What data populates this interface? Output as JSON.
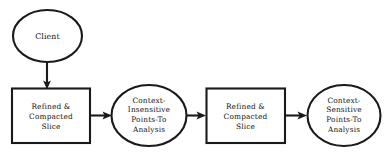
{
  "diagram": {
    "type": "flowchart",
    "background_color": "#ffffff",
    "stroke_color": "#1a1a1a",
    "text_color": "#111111",
    "nodes": [
      {
        "id": "client",
        "shape": "ellipse",
        "label": "Client",
        "lines": [
          "Client"
        ]
      },
      {
        "id": "refined-compacted-slice-1",
        "shape": "rectangle",
        "label": "Refined & Compacted Slice",
        "lines": [
          "Refined &",
          "Compacted",
          "Slice"
        ]
      },
      {
        "id": "context-insensitive-points-to-analysis",
        "shape": "ellipse",
        "label": "Context-Insensitive Points-To Analysis",
        "lines": [
          "Context-",
          "Insensitive",
          "Points-To",
          "Analysis"
        ]
      },
      {
        "id": "refined-compacted-slice-2",
        "shape": "rectangle",
        "label": "Refined & Compacted Slice",
        "lines": [
          "Refined &",
          "Compacted",
          "Slice"
        ]
      },
      {
        "id": "context-sensitive-points-to-analysis",
        "shape": "ellipse",
        "label": "Context-Sensitive Points-To Analysis",
        "lines": [
          "Context-",
          "Sensitive",
          "Points-To",
          "Analysis"
        ]
      }
    ],
    "edges": [
      {
        "id": "edge-client-to-slice1",
        "from": "client",
        "to": "refined-compacted-slice-1",
        "direction": "down",
        "label": ""
      },
      {
        "id": "edge-slice1-to-ci",
        "from": "refined-compacted-slice-1",
        "to": "context-insensitive-points-to-analysis",
        "direction": "right",
        "label": ""
      },
      {
        "id": "edge-ci-to-slice2",
        "from": "context-insensitive-points-to-analysis",
        "to": "refined-compacted-slice-2",
        "direction": "right",
        "label": ""
      },
      {
        "id": "edge-slice2-to-cs",
        "from": "refined-compacted-slice-2",
        "to": "context-sensitive-points-to-analysis",
        "direction": "right",
        "label": ""
      }
    ]
  }
}
